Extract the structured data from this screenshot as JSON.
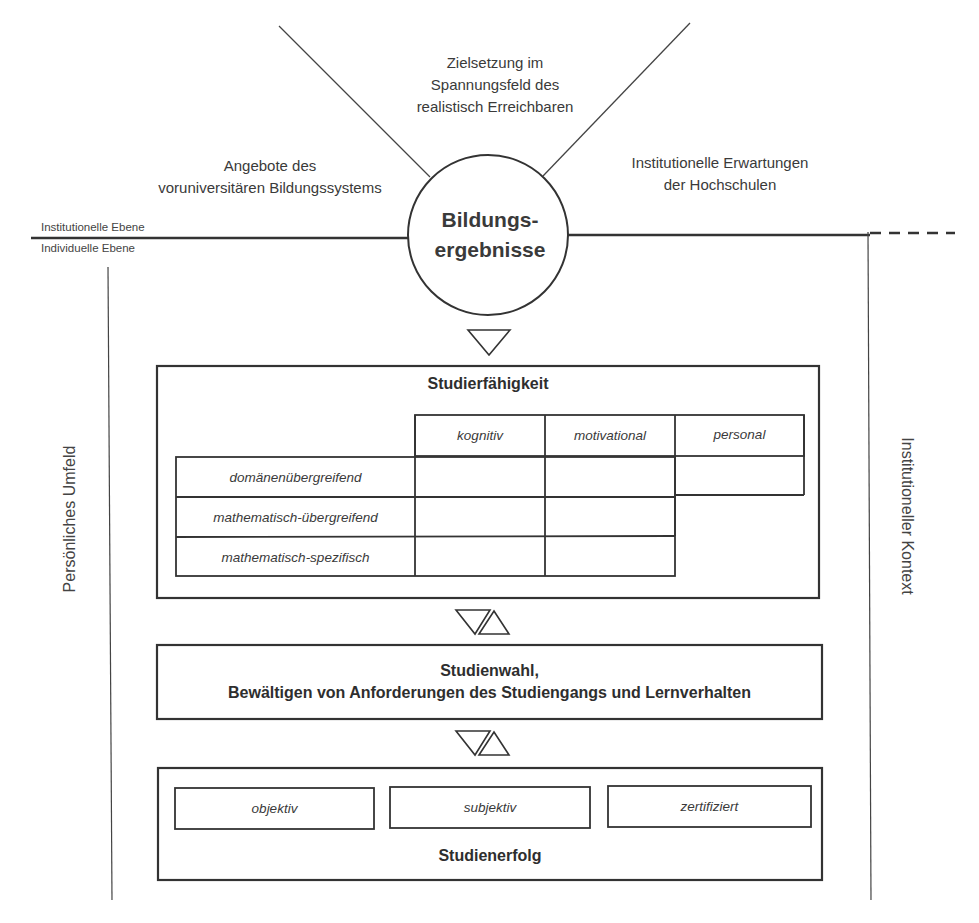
{
  "diagram": {
    "top_labels": {
      "center": [
        "Zielsetzung im",
        "Spannungsfeld des",
        "realistisch Erreichbaren"
      ],
      "left": [
        "Angebote des",
        "voruniversitären Bildungssystems"
      ],
      "right": [
        "Institutionelle Erwartungen",
        "der Hochschulen"
      ]
    },
    "levels": {
      "institutional": "Institutionelle Ebene",
      "individual": "Individuelle Ebene"
    },
    "circle": {
      "line1": "Bildungs-",
      "line2": "ergebnisse"
    },
    "side_labels": {
      "left": "Persönliches Umfeld",
      "right": "Institutioneller Kontext"
    },
    "studierfaehigkeit": {
      "title": "Studierfähigkeit",
      "columns": [
        "kognitiv",
        "motivational",
        "personal"
      ],
      "rows": [
        "domänenübergreifend",
        "mathematisch-übergreifend",
        "mathematisch-spezifisch"
      ]
    },
    "studienwahl": {
      "line1": "Studienwahl,",
      "line2": "Bewältigen von Anforderungen des Studiengangs und Lernverhalten"
    },
    "studienerfolg": {
      "title": "Studienerfolg",
      "items": [
        "objektiv",
        "subjektiv",
        "zertifiziert"
      ]
    },
    "colors": {
      "line": "#333333",
      "text": "#3a3a3a",
      "background": "#ffffff"
    }
  }
}
